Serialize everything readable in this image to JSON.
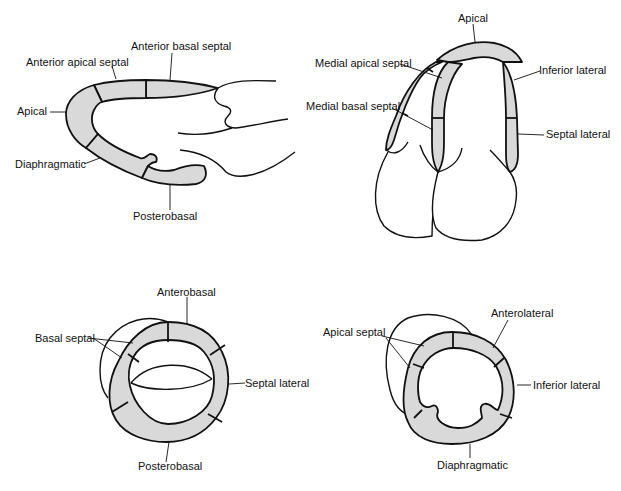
{
  "diagram": {
    "type": "cardiac-ventriculography-segments",
    "fill_color": "#d9d9d9",
    "stroke_color": "#111111",
    "panels": [
      {
        "id": "top-left",
        "view": "right anterior oblique (sagittal)",
        "labels": [
          "Anterior apical septal",
          "Anterior basal septal",
          "Apical",
          "Diaphragmatic",
          "Posterobasal"
        ]
      },
      {
        "id": "top-right",
        "view": "frontal",
        "labels": [
          "Apical",
          "Medial apical septal",
          "Inferior lateral",
          "Medial basal septal",
          "Septal lateral"
        ]
      },
      {
        "id": "bottom-left",
        "view": "basal short-axis",
        "labels": [
          "Anterobasal",
          "Basal septal",
          "Septal lateral",
          "Posterobasal"
        ]
      },
      {
        "id": "bottom-right",
        "view": "apical short-axis",
        "labels": [
          "Anterolateral",
          "Apical septal",
          "Inferior lateral",
          "Diaphragmatic"
        ]
      }
    ]
  },
  "labels": {
    "tl_anterior_apical_septal": "Anterior apical septal",
    "tl_anterior_basal_septal": "Anterior basal septal",
    "tl_apical": "Apical",
    "tl_diaphragmatic": "Diaphragmatic",
    "tl_posterobasal": "Posterobasal",
    "tr_apical": "Apical",
    "tr_medial_apical_septal": "Medial apical septal",
    "tr_inferior_lateral": "Inferior lateral",
    "tr_medial_basal_septal": "Medial basal septal",
    "tr_septal_lateral": "Septal lateral",
    "bl_anterobasal": "Anterobasal",
    "bl_basal_septal": "Basal septal",
    "bl_septal_lateral": "Septal lateral",
    "bl_posterobasal": "Posterobasal",
    "br_anterolateral": "Anterolateral",
    "br_apical_septal": "Apical septal",
    "br_inferior_lateral": "Inferior lateral",
    "br_diaphragmatic": "Diaphragmatic"
  }
}
